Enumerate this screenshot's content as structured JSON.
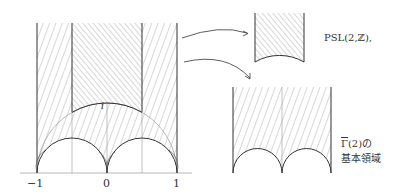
{
  "left_figure": {
    "x_ticks": [
      "−1",
      "0",
      "1"
    ],
    "point_label": "i"
  },
  "right_figures": {
    "top_caption": "PSL(2,ℤ),",
    "bottom_caption_symbol": "Γ",
    "bottom_caption_rest": "(2)の",
    "bottom_caption_line2": "基本領域"
  },
  "colors": {
    "line": "#333333",
    "hatch": "#777777",
    "thin": "#999999"
  }
}
